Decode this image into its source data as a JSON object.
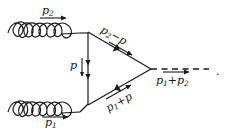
{
  "figure": {
    "type": "feynman-diagram",
    "background_color": "#ffffff",
    "line_color": "#1a1a1a",
    "width": 226,
    "height": 136
  },
  "labels": {
    "incoming_top": {
      "symbol": "p",
      "subscript": "2",
      "text": "p2"
    },
    "incoming_bottom": {
      "symbol": "p",
      "subscript": "1",
      "text": "p1"
    },
    "loop_vertical": {
      "symbol": "p",
      "subscript": "",
      "text": "p"
    },
    "loop_upper": {
      "text": "p2 - p",
      "symbol": "p",
      "subscript": "2",
      "operator": "−",
      "term": "p"
    },
    "loop_lower": {
      "text": "p1 + p",
      "symbol": "p",
      "subscript": "1",
      "operator": "+",
      "term": "p"
    },
    "outgoing": {
      "text": "p1 + p2",
      "symbol": "p",
      "subscript": "1",
      "operator": "+",
      "symbol2": "p",
      "subscript2": "2"
    },
    "trailing_punctuation": "."
  },
  "elements": {
    "gluon_top": {
      "name": "incoming gluon (top)",
      "style": "coiled",
      "coils": 5
    },
    "gluon_bottom": {
      "name": "incoming gluon (bottom)",
      "style": "coiled",
      "coils": 5
    },
    "fermion_vertical": {
      "name": "loop propagator (vertical)",
      "style": "solid",
      "direction": "down"
    },
    "fermion_upper": {
      "name": "loop propagator (upper diagonal)",
      "style": "solid",
      "direction": "right-down"
    },
    "fermion_lower": {
      "name": "loop propagator (lower diagonal)",
      "style": "solid",
      "direction": "right-up"
    },
    "scalar_out": {
      "name": "outgoing scalar",
      "style": "dashed",
      "direction": "right",
      "dashes": 7
    }
  }
}
